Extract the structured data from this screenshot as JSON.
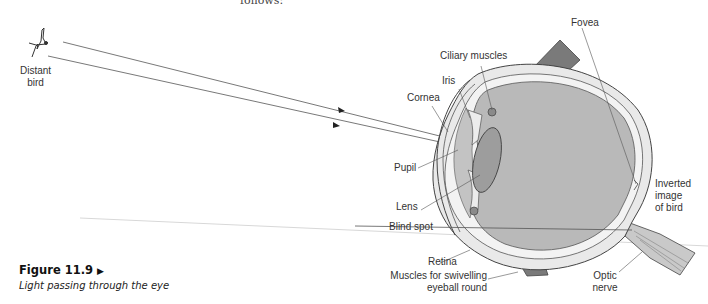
{
  "page": {
    "top_cut_text": "follows:"
  },
  "figure": {
    "number": "Figure 11.9",
    "arrow_glyph": "▶",
    "caption": "Light passing through the eye"
  },
  "labels": {
    "distant_bird": [
      "Distant",
      "bird"
    ],
    "fovea": "Fovea",
    "ciliary_muscles": "Ciliary muscles",
    "iris": "Iris",
    "cornea": "Cornea",
    "pupil": "Pupil",
    "lens": "Lens",
    "blind_spot": "Blind spot",
    "retina": "Retina",
    "muscles": [
      "Muscles for swivelling",
      "eyeball round"
    ],
    "inverted_image": [
      "Inverted",
      "image",
      "of bird"
    ],
    "optic_nerve": [
      "Optic",
      "nerve"
    ]
  },
  "colors": {
    "eye_fill": "#b9b9b9",
    "lens_fill": "#9d9d9d",
    "muscle_fill": "#7a7a7a",
    "outline": "#444444",
    "ray": "#555555"
  }
}
